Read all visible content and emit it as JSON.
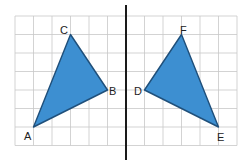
{
  "diagram": {
    "type": "reflection",
    "grid": {
      "columns": 12,
      "rows": 7,
      "origin_px": [
        15,
        16
      ],
      "cell_px": 18.5,
      "line_color": "#c8c8c8"
    },
    "mirror_line": {
      "grid_x": 6,
      "color": "#1a1a1a"
    },
    "fill_color": "#3d8fd1",
    "stroke_color": "#1f4f7a",
    "triangles": [
      {
        "name": "triangle-abc",
        "vertices": [
          {
            "label": "A",
            "grid": [
              1,
              6
            ]
          },
          {
            "label": "B",
            "grid": [
              5,
              4
            ]
          },
          {
            "label": "C",
            "grid": [
              3,
              1
            ]
          }
        ]
      },
      {
        "name": "triangle-def",
        "vertices": [
          {
            "label": "D",
            "grid": [
              7,
              4
            ]
          },
          {
            "label": "E",
            "grid": [
              11,
              6
            ]
          },
          {
            "label": "F",
            "grid": [
              9,
              1
            ]
          }
        ]
      }
    ],
    "labels": {
      "A": "A",
      "B": "B",
      "C": "C",
      "D": "D",
      "E": "E",
      "F": "F"
    }
  }
}
